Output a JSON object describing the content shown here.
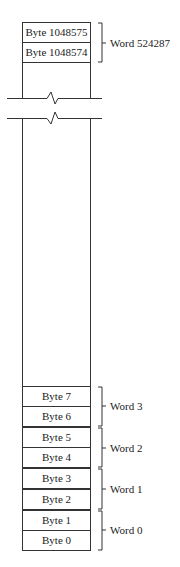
{
  "diagram": {
    "top_cells": [
      {
        "label": "Byte 1048575"
      },
      {
        "label": "Byte 1048574"
      }
    ],
    "top_word": {
      "label": "Word 524287"
    },
    "bottom_cells": [
      {
        "label": "Byte 7"
      },
      {
        "label": "Byte 6"
      },
      {
        "label": "Byte 5"
      },
      {
        "label": "Byte 4"
      },
      {
        "label": "Byte 3"
      },
      {
        "label": "Byte 2"
      },
      {
        "label": "Byte 1"
      },
      {
        "label": "Byte 0"
      }
    ],
    "bottom_words": [
      {
        "label": "Word 3"
      },
      {
        "label": "Word 2"
      },
      {
        "label": "Word 1"
      },
      {
        "label": "Word 0"
      }
    ],
    "line_color": "#333333"
  }
}
